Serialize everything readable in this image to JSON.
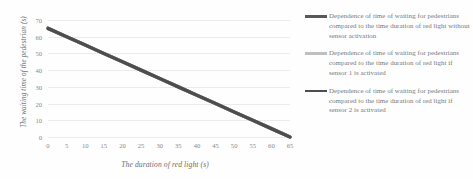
{
  "chart_data": {
    "type": "line",
    "title": "",
    "xlabel": "The duration of red light (s)",
    "ylabel": "The waiting time of the pedestrian (s)",
    "xlim": [
      0,
      65
    ],
    "ylim": [
      0,
      70
    ],
    "xticks": [
      0,
      5,
      10,
      15,
      20,
      25,
      30,
      35,
      40,
      45,
      50,
      55,
      60,
      65
    ],
    "yticks": [
      0,
      10,
      20,
      30,
      40,
      50,
      60,
      70
    ],
    "grid": "horizontal",
    "legend_position": "right",
    "x": [
      0,
      5,
      10,
      15,
      20,
      25,
      30,
      35,
      40,
      45,
      50,
      55,
      60,
      65
    ],
    "series": [
      {
        "name": "Dependence of time of waiting for pedestrians compared to the time duration of red light without sensor activation",
        "color": "#595959",
        "values": [
          65,
          60,
          55,
          50,
          45,
          40,
          35,
          30,
          25,
          20,
          15,
          10,
          5,
          0
        ]
      },
      {
        "name": "Dependence of time of waiting for pedestrians compared to the time duration of red light if sensor 1 is activated",
        "color": "#bfbfbf",
        "values": [
          65,
          60,
          55,
          50,
          45,
          40,
          35,
          30,
          25,
          20,
          15,
          10,
          5,
          0
        ]
      },
      {
        "name": "Dependence of time of waiting for pedestrians compared to the time duration of red light if sensor 2 is activated",
        "color": "#4d4d4d",
        "values": [
          65,
          60,
          55,
          50,
          45,
          40,
          35,
          30,
          25,
          20,
          15,
          10,
          5,
          0
        ]
      }
    ]
  },
  "axis": {
    "x_title": "The duration of red light (s)",
    "y_title": "The waiting time of the pedestrian (s)"
  },
  "legend": {
    "items": [
      {
        "label": "Dependence of time of waiting for pedestrians compared to the time duration of red light without sensor activation",
        "color": "#595959"
      },
      {
        "label": "Dependence of time of waiting for pedestrians compared to the time duration of red light if sensor 1 is activated",
        "color": "#bfbfbf"
      },
      {
        "label": "Dependence of time of waiting for pedestrians compared to the time duration of red light if sensor 2 is activated",
        "color": "#4d4d4d"
      }
    ]
  }
}
